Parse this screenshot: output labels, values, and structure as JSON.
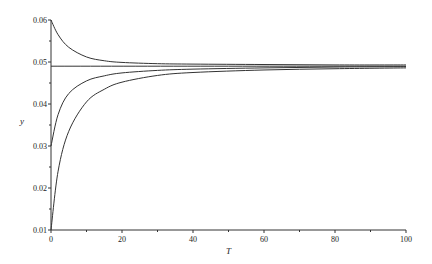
{
  "chart_data": {
    "type": "line",
    "title": "",
    "xlabel": "T",
    "ylabel": "y",
    "xlim": [
      0,
      100
    ],
    "ylim": [
      0.01,
      0.06
    ],
    "grid": false,
    "legend": null,
    "x_ticks": [
      0,
      20,
      40,
      60,
      80,
      100
    ],
    "x_tick_labels": [
      "0",
      "20",
      "40",
      "60",
      "80",
      "100"
    ],
    "y_ticks": [
      0.01,
      0.02,
      0.03,
      0.04,
      0.05,
      0.06
    ],
    "y_tick_labels": [
      "0.01",
      "0.02",
      "0.03",
      "0.04",
      "0.05",
      "0.06"
    ],
    "series": [
      {
        "name": "y0=0.06",
        "x": [
          0,
          2,
          5,
          10,
          15,
          20,
          30,
          40,
          60,
          80,
          100
        ],
        "values": [
          0.06,
          0.0565,
          0.0535,
          0.0512,
          0.0503,
          0.0499,
          0.0496,
          0.0495,
          0.0494,
          0.0493,
          0.0493
        ]
      },
      {
        "name": "equilibrium",
        "x": [
          0,
          100
        ],
        "values": [
          0.049,
          0.049
        ]
      },
      {
        "name": "y0=0.03",
        "x": [
          0,
          2,
          5,
          10,
          15,
          20,
          30,
          40,
          60,
          80,
          100
        ],
        "values": [
          0.03,
          0.0375,
          0.0425,
          0.0455,
          0.0467,
          0.0474,
          0.048,
          0.0483,
          0.0486,
          0.0488,
          0.0489
        ]
      },
      {
        "name": "y0=0.01",
        "x": [
          0,
          2,
          5,
          10,
          15,
          20,
          30,
          40,
          60,
          80,
          100
        ],
        "values": [
          0.01,
          0.024,
          0.0335,
          0.0405,
          0.0435,
          0.0452,
          0.0468,
          0.0475,
          0.0481,
          0.0484,
          0.0486
        ]
      }
    ]
  }
}
